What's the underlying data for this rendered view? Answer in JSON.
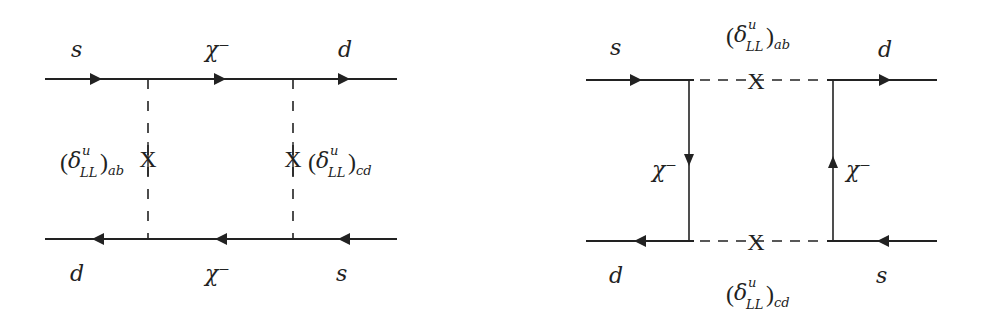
{
  "figure": {
    "colors": {
      "line": "#222222",
      "background": "#ffffff"
    }
  },
  "diagram_left": {
    "top_line": {
      "left_label": "s",
      "middle_label": "χ⁻",
      "right_label": "d"
    },
    "bottom_line": {
      "left_label": "d",
      "middle_label": "χ⁻",
      "right_label": "s"
    },
    "insertion_left": {
      "delta": "δ",
      "sup": "u",
      "sub_inner": "LL",
      "sub_outer": "ab",
      "mark": "X"
    },
    "insertion_right": {
      "delta": "δ",
      "sup": "u",
      "sub_inner": "LL",
      "sub_outer": "cd",
      "mark": "X"
    }
  },
  "diagram_right": {
    "top_line": {
      "left_label": "s",
      "right_label": "d"
    },
    "bottom_line": {
      "left_label": "d",
      "right_label": "s"
    },
    "vertical_left_label": "χ⁻",
    "vertical_right_label": "χ⁻",
    "insertion_top": {
      "delta": "δ",
      "sup": "u",
      "sub_inner": "LL",
      "sub_outer": "ab",
      "mark": "X"
    },
    "insertion_bottom": {
      "delta": "δ",
      "sup": "u",
      "sub_inner": "LL",
      "sub_outer": "cd",
      "mark": "X"
    }
  },
  "paren_open": "(",
  "paren_close": ")"
}
